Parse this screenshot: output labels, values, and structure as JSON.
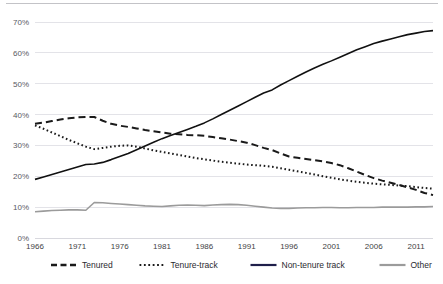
{
  "chart_data": {
    "type": "line",
    "title": "",
    "subtitle": "",
    "xlabel": "",
    "ylabel": "",
    "xlim": [
      1966,
      2013
    ],
    "ylim": [
      0,
      0.7
    ],
    "grid": true,
    "legend_position": "bottom",
    "y_tick_labels": [
      "0%",
      "10%",
      "20%",
      "30%",
      "40%",
      "50%",
      "60%",
      "70%"
    ],
    "y_tick_values": [
      0,
      10,
      20,
      30,
      40,
      50,
      60,
      70
    ],
    "x_tick_labels": [
      "1966",
      "1971",
      "1976",
      "1981",
      "1986",
      "1991",
      "1996",
      "2001",
      "2006",
      "2011"
    ],
    "x_tick_values": [
      1966,
      1971,
      1976,
      1981,
      1986,
      1991,
      1996,
      2001,
      2006,
      2011
    ],
    "x": [
      1966,
      1967,
      1968,
      1969,
      1970,
      1971,
      1972,
      1973,
      1974,
      1975,
      1976,
      1977,
      1978,
      1979,
      1980,
      1981,
      1982,
      1983,
      1984,
      1985,
      1986,
      1987,
      1988,
      1989,
      1990,
      1991,
      1992,
      1993,
      1994,
      1995,
      1996,
      1997,
      1998,
      1999,
      2000,
      2001,
      2002,
      2003,
      2004,
      2005,
      2006,
      2007,
      2008,
      2009,
      2010,
      2011,
      2012,
      2013
    ],
    "series": [
      {
        "name": "Tenured",
        "style": "dashed",
        "color": "#1a1a1a",
        "values": [
          37.0,
          37.4,
          37.9,
          38.4,
          38.8,
          39.1,
          39.2,
          39.2,
          38.0,
          37.0,
          36.4,
          36.0,
          35.5,
          35.0,
          34.6,
          34.2,
          33.8,
          33.6,
          33.4,
          33.3,
          33.1,
          32.7,
          32.3,
          31.9,
          31.4,
          30.9,
          30.1,
          29.2,
          28.5,
          27.4,
          26.4,
          26.0,
          25.6,
          25.2,
          24.8,
          24.3,
          23.6,
          22.6,
          21.5,
          20.4,
          19.4,
          18.6,
          17.9,
          17.2,
          16.4,
          15.6,
          14.6,
          13.9
        ],
        "end_value": 13.9,
        "start_value": 37.0,
        "peak_value": 39.2,
        "peak_year": 1972
      },
      {
        "name": "Tenure-track",
        "style": "dotted",
        "color": "#1a1a1a",
        "values": [
          36.5,
          35.4,
          34.2,
          33.0,
          31.8,
          30.7,
          29.6,
          28.8,
          29.2,
          29.6,
          29.9,
          30.0,
          29.6,
          29.0,
          28.4,
          27.9,
          27.4,
          26.9,
          26.4,
          25.9,
          25.5,
          25.1,
          24.7,
          24.4,
          24.1,
          23.8,
          23.6,
          23.4,
          23.1,
          22.6,
          22.1,
          21.6,
          21.1,
          20.6,
          20.0,
          19.5,
          19.0,
          18.6,
          18.2,
          17.9,
          17.6,
          17.4,
          17.2,
          17.0,
          16.8,
          16.5,
          16.2,
          16.0
        ],
        "end_value": 16.0,
        "start_value": 36.5,
        "trough_value": 28.8,
        "trough_year": 1973
      },
      {
        "name": "Non-tenure track",
        "style": "solid",
        "color": "#111111",
        "values": [
          19.0,
          19.8,
          20.6,
          21.4,
          22.2,
          23.0,
          23.8,
          24.0,
          24.5,
          25.4,
          26.4,
          27.4,
          28.6,
          29.8,
          31.0,
          32.2,
          33.2,
          34.2,
          35.2,
          36.2,
          37.3,
          38.6,
          40.0,
          41.4,
          42.8,
          44.2,
          45.6,
          47.0,
          48.0,
          49.6,
          51.0,
          52.4,
          53.8,
          55.1,
          56.3,
          57.4,
          58.6,
          59.8,
          61.0,
          62.0,
          63.0,
          63.8,
          64.5,
          65.2,
          65.9,
          66.4,
          66.9,
          67.2
        ],
        "end_value": 67.2,
        "start_value": 19.0
      },
      {
        "name": "Other",
        "style": "solid",
        "color": "#9b9b9b",
        "values": [
          8.5,
          8.7,
          8.9,
          9.0,
          9.1,
          9.1,
          9.0,
          11.5,
          11.4,
          11.2,
          11.0,
          10.8,
          10.6,
          10.4,
          10.3,
          10.2,
          10.4,
          10.6,
          10.7,
          10.6,
          10.5,
          10.7,
          10.8,
          10.9,
          10.8,
          10.6,
          10.3,
          10.0,
          9.7,
          9.6,
          9.6,
          9.7,
          9.8,
          9.8,
          9.9,
          9.9,
          9.8,
          9.8,
          9.9,
          9.9,
          9.9,
          10.0,
          10.0,
          10.0,
          10.0,
          10.1,
          10.1,
          10.2
        ],
        "end_value": 10.2,
        "start_value": 8.5,
        "peak_value": 11.5,
        "peak_year": 1973
      }
    ],
    "legend": [
      {
        "label": "Tenured",
        "style": "dashed",
        "color": "#1a1a1a"
      },
      {
        "label": "Tenure-track",
        "style": "dotted",
        "color": "#1a1a1a"
      },
      {
        "label": "Non-tenure track",
        "style": "solid",
        "color": "#1f1f4a"
      },
      {
        "label": "Other",
        "style": "solid",
        "color": "#9b9b9b"
      }
    ],
    "colors": {
      "gridline": "#e3e3e8",
      "axis": "#d8d8de",
      "tick_text": "#59595f",
      "xtick_text": "#3f3f45",
      "legend_text": "#2a2a30",
      "background": "#ffffff"
    }
  }
}
